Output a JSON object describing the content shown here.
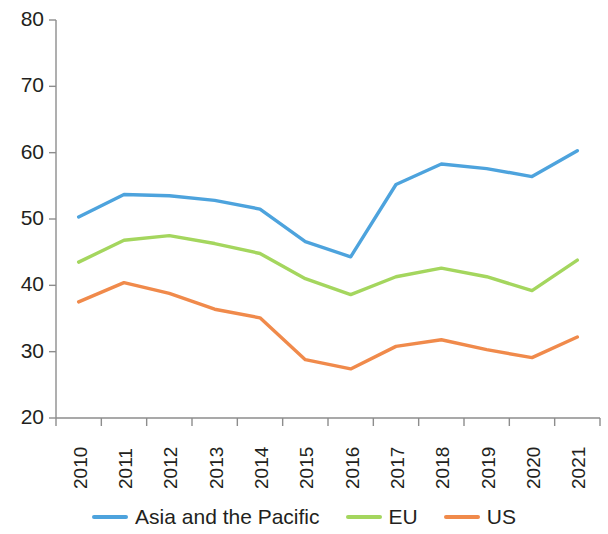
{
  "chart_data": {
    "type": "line",
    "title": "",
    "subtitle": "",
    "xlabel": "",
    "ylabel": "",
    "categories": [
      "2010",
      "2011",
      "2012",
      "2013",
      "2014",
      "2015",
      "2016",
      "2017",
      "2018",
      "2019",
      "2020",
      "2021"
    ],
    "x": [
      2010,
      2011,
      2012,
      2013,
      2014,
      2015,
      2016,
      2017,
      2018,
      2019,
      2020,
      2021
    ],
    "ylim": [
      20,
      80
    ],
    "yticks": [
      20,
      30,
      40,
      50,
      60,
      70,
      80
    ],
    "grid": false,
    "legend_position": "bottom",
    "series": [
      {
        "name": "Asia and the Pacific",
        "color": "#4da3dd",
        "values": [
          50.3,
          53.7,
          53.5,
          52.8,
          51.5,
          46.6,
          44.3,
          55.2,
          58.3,
          57.6,
          56.4,
          60.3
        ]
      },
      {
        "name": "EU",
        "color": "#a4d65e",
        "values": [
          43.5,
          46.8,
          47.5,
          46.3,
          44.8,
          41.0,
          38.6,
          41.3,
          42.6,
          41.3,
          39.2,
          43.8
        ]
      },
      {
        "name": "US",
        "color": "#f08a4b",
        "values": [
          37.5,
          40.4,
          38.8,
          36.4,
          35.1,
          28.8,
          27.4,
          30.8,
          31.8,
          30.3,
          29.1,
          32.2
        ]
      }
    ]
  },
  "axes": {
    "y_tick_labels": [
      "80",
      "70",
      "60",
      "50",
      "40",
      "30",
      "20"
    ],
    "x_tick_labels": [
      "2010",
      "2011",
      "2012",
      "2013",
      "2014",
      "2015",
      "2016",
      "2017",
      "2018",
      "2019",
      "2020",
      "2021"
    ],
    "axis_color": "#8d8d8d"
  },
  "legend": {
    "items": [
      {
        "label": "Asia and the Pacific",
        "color": "#4da3dd"
      },
      {
        "label": "EU",
        "color": "#a4d65e"
      },
      {
        "label": "US",
        "color": "#f08a4b"
      }
    ]
  }
}
